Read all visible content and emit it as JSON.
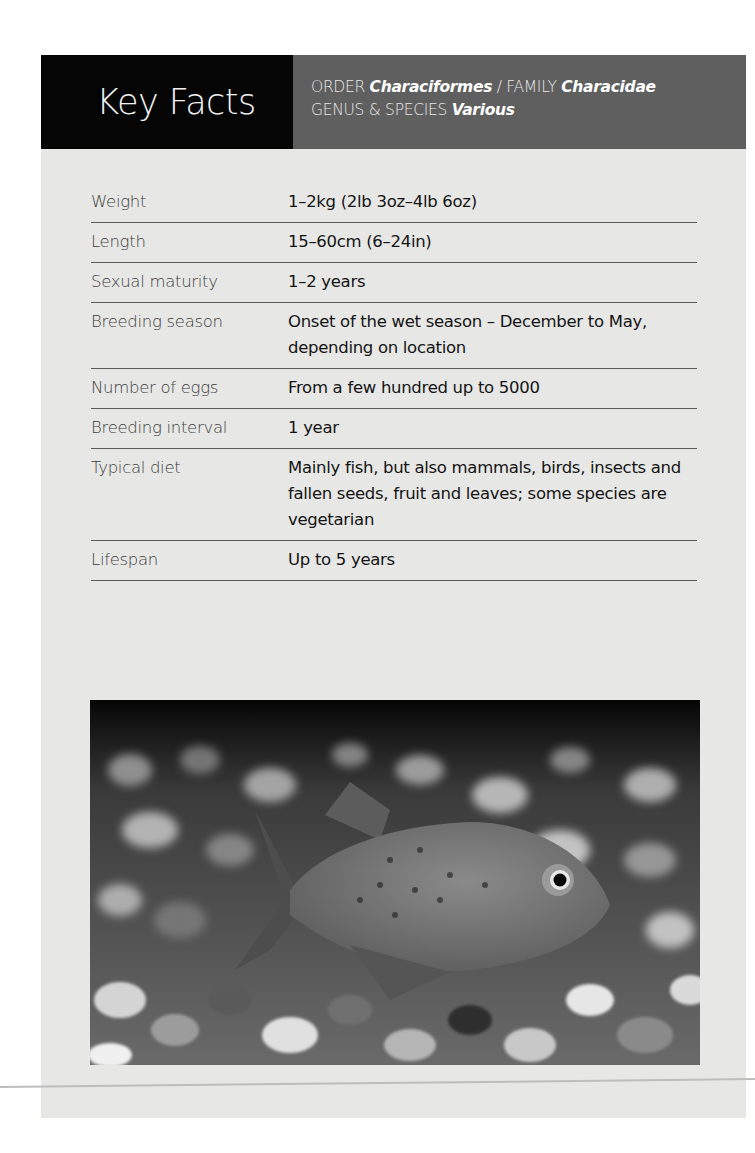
{
  "header": {
    "title": "Key Facts",
    "taxonomy": {
      "order_label": "ORDER",
      "order_value": "Characiformes",
      "separator": " / ",
      "family_label": "FAMILY",
      "family_value": "Characidae",
      "genus_label": "GENUS & SPECIES",
      "genus_value": "Various"
    }
  },
  "facts": [
    {
      "label": "Weight",
      "value": "1–2kg (2lb 3oz–4lb 6oz)"
    },
    {
      "label": "Length",
      "value": "15–60cm (6–24in)"
    },
    {
      "label": "Sexual maturity",
      "value": "1–2 years"
    },
    {
      "label": "Breeding season",
      "value": "Onset of the wet season – December to May, depending on location"
    },
    {
      "label": "Number of eggs",
      "value": "From a few hundred up to 5000"
    },
    {
      "label": "Breeding interval",
      "value": "1 year"
    },
    {
      "label": "Typical diet",
      "value": "Mainly fish, but also mammals, birds, insects and fallen seeds, fruit and leaves; some species are vegetarian"
    },
    {
      "label": "Lifespan",
      "value": "Up to 5 years"
    }
  ],
  "photo": {
    "subject": "piranha fish over gravel (greyscale)"
  },
  "colors": {
    "title_bg": "#050505",
    "taxon_bg": "#5f5f5f",
    "panel_bg": "#e7e7e6",
    "rule": "#5a5a5a"
  }
}
